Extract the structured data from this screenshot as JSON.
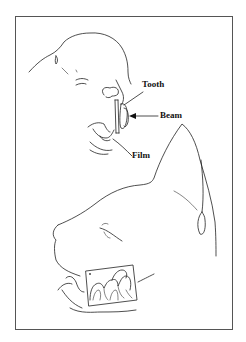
{
  "diagram": {
    "type": "veterinary dental radiography illustration",
    "figure_top": {
      "subject": "cat head, front/three-quarter view, mouth open",
      "labels": [
        {
          "id": "tooth",
          "text": "Tooth"
        },
        {
          "id": "beam",
          "text": "Beam"
        },
        {
          "id": "film",
          "text": "Film"
        }
      ]
    },
    "figure_bottom": {
      "subject": "cat head, lateral view, with intraoral film showing molars"
    },
    "colors": {
      "line": "#222222",
      "border": "#555555",
      "background": "#ffffff"
    }
  }
}
